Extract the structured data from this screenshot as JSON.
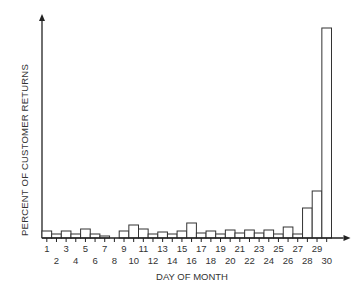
{
  "chart_data": {
    "type": "bar",
    "title": "",
    "xlabel": "DAY OF MONTH",
    "ylabel": "PERCENT OF CUSTOMER RETURNS",
    "categories": [
      "1",
      "2",
      "3",
      "4",
      "5",
      "6",
      "7",
      "8",
      "9",
      "10",
      "11",
      "12",
      "13",
      "14",
      "15",
      "16",
      "17",
      "18",
      "19",
      "20",
      "21",
      "22",
      "23",
      "24",
      "25",
      "26",
      "27",
      "28",
      "29",
      "30"
    ],
    "values": [
      7,
      4,
      7,
      4,
      9,
      4,
      2,
      0,
      7,
      13,
      9,
      4,
      6,
      4,
      7,
      15,
      5,
      7,
      4,
      8,
      5,
      8,
      5,
      8,
      4,
      11,
      4,
      30,
      47,
      210
    ],
    "value_units": "relative (no y-axis scale shown)",
    "ylim": [
      0,
      230
    ],
    "grid": false,
    "legend": null,
    "x_tick_rows": {
      "odd": [
        "1",
        "3",
        "5",
        "7",
        "9",
        "11",
        "13",
        "15",
        "17",
        "19",
        "21",
        "23",
        "25",
        "27",
        "29"
      ],
      "even": [
        "2",
        "4",
        "6",
        "8",
        "10",
        "12",
        "14",
        "16",
        "18",
        "20",
        "22",
        "24",
        "26",
        "28",
        "30"
      ]
    },
    "bar_fill": "#ffffff",
    "bar_stroke": "#333333",
    "axis_color": "#222222"
  }
}
